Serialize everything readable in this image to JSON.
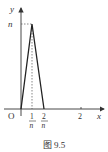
{
  "figure": {
    "caption": "图 9.5",
    "axes": {
      "x_label": "x",
      "y_label": "y",
      "origin_label": "O",
      "x_ticks": [
        {
          "num": "1",
          "den": "n"
        },
        {
          "num": "2",
          "den": "n"
        },
        {
          "label": "2"
        }
      ],
      "y_ticks": [
        {
          "label": "n"
        }
      ]
    },
    "curve": {
      "description": "triangular spike: from (0,0) up to (1/n, n) down to (2/n, 0), then zero along x-axis",
      "points": [
        [
          "0",
          "0"
        ],
        [
          "1/n",
          "n"
        ],
        [
          "2/n",
          "0"
        ]
      ]
    },
    "colors": {
      "line": "#222222",
      "text": "#333333",
      "dashed": "#555555"
    }
  }
}
